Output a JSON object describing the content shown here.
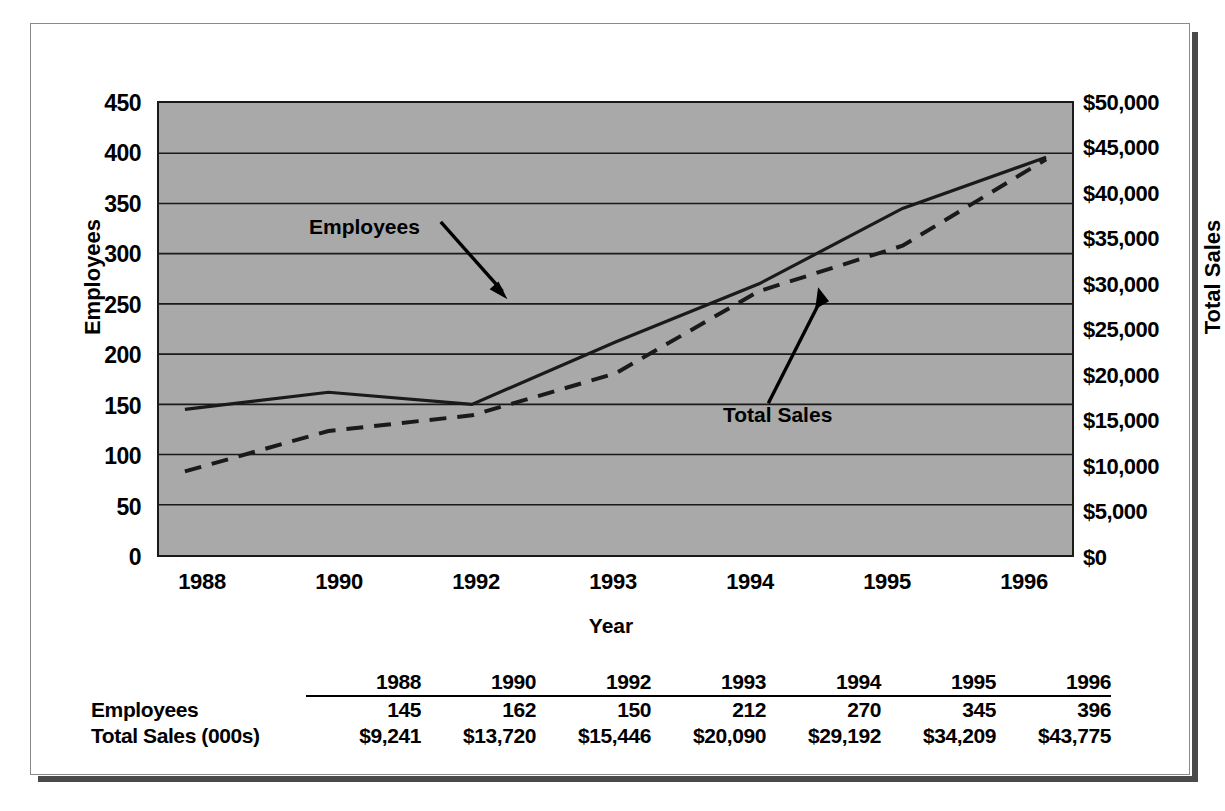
{
  "chart_data": {
    "type": "line",
    "title": "",
    "xlabel": "Year",
    "ylabel": "Employees",
    "y2label": "Total Sales",
    "categories": [
      "1988",
      "1990",
      "1992",
      "1993",
      "1994",
      "1995",
      "1996"
    ],
    "x": [
      1988,
      1990,
      1992,
      1993,
      1994,
      1995,
      1996
    ],
    "ylim": [
      0,
      450
    ],
    "y2lim": [
      0,
      50000
    ],
    "yticks": [
      "0",
      "50",
      "100",
      "150",
      "200",
      "250",
      "300",
      "350",
      "400",
      "450"
    ],
    "y2ticks": [
      "$0",
      "$5,000",
      "$10,000",
      "$15,000",
      "$20,000",
      "$25,000",
      "$30,000",
      "$35,000",
      "$40,000",
      "$45,000",
      "$50,000"
    ],
    "grid": true,
    "legend": "annotations",
    "series": [
      {
        "name": "Employees",
        "axis": "left",
        "style": "solid",
        "values": [
          145,
          162,
          150,
          212,
          270,
          345,
          396
        ]
      },
      {
        "name": "Total Sales",
        "axis": "right",
        "style": "dashed",
        "values": [
          9241,
          13720,
          15446,
          20090,
          29192,
          34209,
          43775
        ]
      }
    ],
    "annotations": [
      {
        "text": "Employees",
        "points_to": "employees-line"
      },
      {
        "text": "Total Sales",
        "points_to": "total-sales-line"
      }
    ],
    "colors": {
      "plot_background": "#a9a9a9",
      "line": "#1a1a1a",
      "grid": "#1a1a1a",
      "text": "#000000"
    }
  },
  "table": {
    "corner_label": "",
    "headers": [
      "1988",
      "1990",
      "1992",
      "1993",
      "1994",
      "1995",
      "1996"
    ],
    "rows": [
      {
        "label": "Employees",
        "values": [
          "145",
          "162",
          "150",
          "212",
          "270",
          "345",
          "396"
        ]
      },
      {
        "label": "Total Sales (000s)",
        "values": [
          "$9,241",
          "$13,720",
          "$15,446",
          "$20,090",
          "$29,192",
          "$34,209",
          "$43,775"
        ]
      }
    ]
  }
}
